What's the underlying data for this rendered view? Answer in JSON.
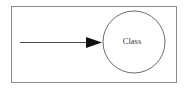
{
  "diagram": {
    "type": "uml-class-association-diagram",
    "background_color": "#ffffff",
    "frame": {
      "name": "diagram-frame",
      "x": 11,
      "y": 6,
      "width": 165,
      "height": 76,
      "stroke_color": "#8a8a8a",
      "stroke_width": 1,
      "fill_color": "#ffffff"
    },
    "nodes": [
      {
        "id": "class-node",
        "shape": "circle",
        "label": "Class",
        "cx": 134,
        "cy": 42,
        "r": 31,
        "stroke_color": "#6d6d6d",
        "stroke_width": 1,
        "fill_color": "#ffffff",
        "label_color": "#3a3a3a",
        "label_x": 132,
        "label_y": 42,
        "label_font_size": 8.5
      }
    ],
    "edges": [
      {
        "id": "incoming-association",
        "label": "",
        "from_x": 20,
        "from_y": 42,
        "to_x": 102,
        "to_y": 42,
        "stroke_color": "#4a4a4a",
        "stroke_width": 1,
        "arrowhead": {
          "name": "solid-triangle-arrowhead",
          "style": "filled-triangle",
          "tip_x": 102,
          "tip_y": 42,
          "base_x": 86,
          "half_height": 5,
          "fill_color": "#111111"
        }
      }
    ]
  }
}
